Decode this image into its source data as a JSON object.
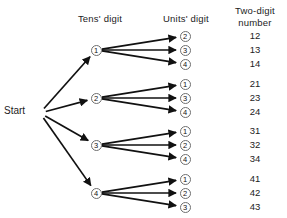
{
  "diagram": {
    "type": "tree-diagram",
    "title_absent": true,
    "headers": {
      "tens": "Tens'  digit",
      "units": "Units'  digit",
      "result_line1": "Two-digit",
      "result_line2": "number"
    },
    "start_label": "Start",
    "colors": {
      "edge": "#111111",
      "node_stroke": "#6e6e6e",
      "node_fill": "#ffffff",
      "text": "#1c1c1c",
      "background": "#ffffff"
    },
    "geometry": {
      "start": {
        "x": 40,
        "y": 113
      },
      "tens_x": 96,
      "units_x": 185,
      "result_x": 238,
      "node_radius": 5.5
    },
    "branches": [
      {
        "tens": "1",
        "tens_y": 50,
        "units": [
          {
            "label": "2",
            "y": 36,
            "result": "12"
          },
          {
            "label": "3",
            "y": 50,
            "result": "13"
          },
          {
            "label": "4",
            "y": 64,
            "result": "14"
          }
        ]
      },
      {
        "tens": "2",
        "tens_y": 98,
        "units": [
          {
            "label": "1",
            "y": 84,
            "result": "21"
          },
          {
            "label": "3",
            "y": 98,
            "result": "23"
          },
          {
            "label": "4",
            "y": 112,
            "result": "24"
          }
        ]
      },
      {
        "tens": "3",
        "tens_y": 145,
        "units": [
          {
            "label": "1",
            "y": 131,
            "result": "31"
          },
          {
            "label": "2",
            "y": 145,
            "result": "32"
          },
          {
            "label": "4",
            "y": 159,
            "result": "34"
          }
        ]
      },
      {
        "tens": "4",
        "tens_y": 193,
        "units": [
          {
            "label": "1",
            "y": 179,
            "result": "41"
          },
          {
            "label": "2",
            "y": 193,
            "result": "42"
          },
          {
            "label": "3",
            "y": 207,
            "result": "43"
          }
        ]
      }
    ]
  }
}
